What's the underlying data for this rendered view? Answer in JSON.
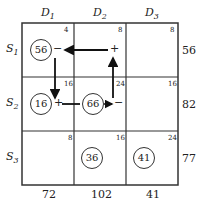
{
  "columns": [
    "D1",
    "D2",
    "D3"
  ],
  "rows": [
    "S1",
    "S2",
    "S3"
  ],
  "costs": [
    [
      "4",
      "8",
      "8"
    ],
    [
      "16",
      "24",
      "16"
    ],
    [
      "8",
      "16",
      "24"
    ]
  ],
  "supply": [
    "56",
    "82",
    "77"
  ],
  "demand": [
    "72",
    "102",
    "41"
  ],
  "allocations": {
    "s1d1": "56",
    "s2d1": "16",
    "s2d2": "66",
    "s3d2": "36",
    "s3d3": "41"
  },
  "signs": {
    "s1d1": "−",
    "s1d2": "+",
    "s2d1": "+",
    "s2d2": "−"
  }
}
